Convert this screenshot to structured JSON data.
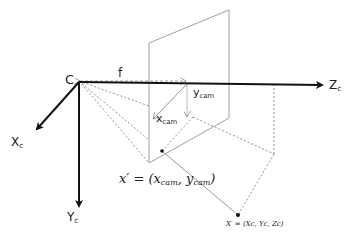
{
  "diagram": {
    "labels": {
      "camera_center": "C",
      "focal_length": "f",
      "axis_z": {
        "main": "Z",
        "sub": "c"
      },
      "axis_x": {
        "main": "X",
        "sub": "c"
      },
      "axis_y": {
        "main": "Y",
        "sub": "c"
      },
      "image_x": {
        "main": "x",
        "sub": "cam"
      },
      "image_y": {
        "main": "y",
        "sub": "cam"
      },
      "image_point": "x′ = (x",
      "image_point_sub1": "cam",
      "image_point_mid": ", y",
      "image_point_sub2": "cam",
      "image_point_end": ")",
      "world_point": "X′ = (Xc, Yc, Zc)"
    },
    "colors": {
      "axis": "#111111",
      "plane": "#9a9a9a",
      "dashed": "#777777",
      "text": "#222222"
    }
  }
}
